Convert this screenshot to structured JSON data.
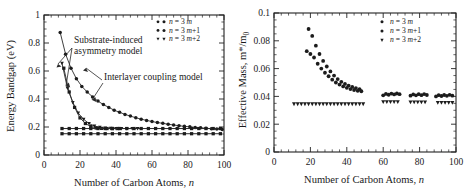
{
  "figure": {
    "panels": [
      "left",
      "right"
    ]
  },
  "chart_data": [
    {
      "type": "scatter",
      "panel": "left",
      "title": "",
      "xlabel": "Number of Carbon Atoms, n",
      "ylabel": "Energy Bandgap (eV)",
      "xlim": [
        0,
        100
      ],
      "ylim": [
        0,
        1
      ],
      "xticks": [
        0,
        20,
        40,
        60,
        80,
        100
      ],
      "yticks": [
        0,
        0.2,
        0.4,
        0.6,
        0.8,
        1
      ],
      "grid": false,
      "legend_position": "top-right",
      "legend": [
        "n = 3m",
        "n = 3m+1",
        "n = 3m+2"
      ],
      "annotations": [
        "Substrate-induced asymmetry model",
        "Interlayer coupling model"
      ],
      "series": [
        {
          "name": "substrate n = 3m",
          "marker": "circle",
          "connected": true,
          "x": [
            9,
            12,
            15,
            18,
            21,
            24,
            27,
            30,
            33,
            36,
            39,
            42,
            45,
            48,
            51,
            54,
            57,
            60,
            63,
            66,
            69,
            72,
            75,
            78,
            81,
            84,
            87,
            90,
            93,
            96,
            99
          ],
          "y": [
            0.875,
            0.72,
            0.62,
            0.545,
            0.49,
            0.45,
            0.415,
            0.385,
            0.36,
            0.34,
            0.32,
            0.305,
            0.29,
            0.278,
            0.266,
            0.256,
            0.247,
            0.239,
            0.232,
            0.226,
            0.22,
            0.214,
            0.209,
            0.205,
            0.201,
            0.197,
            0.194,
            0.191,
            0.188,
            0.185,
            0.183
          ]
        },
        {
          "name": "substrate n = 3m+2",
          "marker": "triangle-down",
          "connected": true,
          "x": [
            10,
            13,
            16,
            19,
            22,
            25,
            28,
            31,
            34,
            37,
            40,
            43,
            46,
            49,
            52
          ],
          "y": [
            0.655,
            0.478,
            0.375,
            0.3,
            0.255,
            0.225,
            0.207,
            0.197,
            0.192,
            0.19,
            0.189,
            0.189,
            0.189,
            0.189,
            0.189
          ]
        },
        {
          "name": "substrate n = 3m+1",
          "marker": "square",
          "connected": true,
          "x": [
            11,
            14,
            17,
            20,
            23,
            26,
            29,
            32,
            35,
            38,
            41
          ],
          "y": [
            0.62,
            0.45,
            0.34,
            0.265,
            0.225,
            0.203,
            0.193,
            0.19,
            0.189,
            0.189,
            0.189
          ]
        },
        {
          "name": "interlayer upper (n = 3m / 3m+1)",
          "marker": "square",
          "connected": true,
          "x": [
            10,
            14,
            18,
            22,
            26,
            30,
            34,
            38,
            42,
            46,
            50,
            54,
            58,
            62,
            66,
            70,
            74,
            78,
            82,
            86,
            90,
            94,
            98
          ],
          "y": [
            0.189,
            0.189,
            0.189,
            0.189,
            0.189,
            0.189,
            0.189,
            0.189,
            0.189,
            0.189,
            0.189,
            0.189,
            0.189,
            0.189,
            0.189,
            0.189,
            0.189,
            0.189,
            0.189,
            0.189,
            0.189,
            0.189,
            0.189
          ]
        },
        {
          "name": "interlayer lower (n = 3m+2)",
          "marker": "square",
          "connected": true,
          "x": [
            10,
            14,
            18,
            22,
            26,
            30,
            34,
            38,
            42,
            46,
            50,
            54,
            58,
            62,
            66,
            70,
            74,
            78,
            82,
            86,
            90,
            94,
            98
          ],
          "y": [
            0.152,
            0.152,
            0.152,
            0.152,
            0.152,
            0.152,
            0.152,
            0.152,
            0.152,
            0.152,
            0.152,
            0.152,
            0.152,
            0.152,
            0.152,
            0.152,
            0.152,
            0.152,
            0.152,
            0.152,
            0.152,
            0.152,
            0.152
          ]
        }
      ]
    },
    {
      "type": "scatter",
      "panel": "right",
      "title": "",
      "xlabel": "Number of Carbon Atoms, n",
      "ylabel": "Effective Mass, m*/m0",
      "xlim": [
        0,
        100
      ],
      "ylim": [
        0,
        0.1
      ],
      "xticks": [
        0,
        20,
        40,
        60,
        80,
        100
      ],
      "yticks": [
        0,
        0.02,
        0.04,
        0.06,
        0.08,
        0.1
      ],
      "grid": false,
      "legend_position": "top-right",
      "legend": [
        "n = 3m",
        "n = 3m+1",
        "n = 3m+2"
      ],
      "annotations": [],
      "series": [
        {
          "name": "descending upper branch",
          "marker": "circle",
          "connected": false,
          "x": [
            19,
            21,
            23,
            25,
            27,
            29,
            31,
            33,
            35,
            37,
            39,
            41,
            43,
            45,
            47
          ],
          "y": [
            0.0885,
            0.0835,
            0.0765,
            0.0705,
            0.0655,
            0.0615,
            0.058,
            0.055,
            0.0525,
            0.0505,
            0.049,
            0.0478,
            0.0468,
            0.046,
            0.0452
          ]
        },
        {
          "name": "descending lower branch",
          "marker": "circle",
          "connected": false,
          "x": [
            18,
            20,
            22,
            24,
            26,
            28,
            30,
            32,
            34,
            36,
            38,
            40,
            42,
            44,
            46,
            48
          ],
          "y": [
            0.0725,
            0.0705,
            0.068,
            0.0635,
            0.06,
            0.057,
            0.0545,
            0.052,
            0.05,
            0.0485,
            0.0472,
            0.0462,
            0.0453,
            0.0446,
            0.044,
            0.0437
          ]
        },
        {
          "name": "flat baseline",
          "marker": "triangle-down",
          "connected": false,
          "x": [
            11,
            13,
            15,
            17,
            19,
            21,
            23,
            25,
            27,
            29,
            31,
            33,
            35,
            37,
            39,
            41,
            43,
            45,
            47,
            49
          ],
          "y": [
            0.0345,
            0.0345,
            0.0345,
            0.0345,
            0.0345,
            0.0345,
            0.0345,
            0.0345,
            0.0345,
            0.0345,
            0.0345,
            0.0345,
            0.0345,
            0.0345,
            0.0345,
            0.0345,
            0.0345,
            0.0345,
            0.0345,
            0.0345
          ]
        },
        {
          "name": "cluster A upper",
          "marker": "circle",
          "connected": false,
          "x": [
            60,
            61.5,
            63,
            64.5,
            66,
            67.5,
            69
          ],
          "y": [
            0.0408,
            0.0418,
            0.0412,
            0.042,
            0.0414,
            0.0421,
            0.0416
          ]
        },
        {
          "name": "cluster A lower",
          "marker": "triangle-down",
          "connected": false,
          "x": [
            60,
            62,
            64,
            66,
            68
          ],
          "y": [
            0.036,
            0.036,
            0.036,
            0.036,
            0.036
          ]
        },
        {
          "name": "cluster B upper",
          "marker": "circle",
          "connected": false,
          "x": [
            75,
            76.5,
            78,
            79.5,
            81,
            82.5,
            84
          ],
          "y": [
            0.0405,
            0.0414,
            0.0408,
            0.0416,
            0.0409,
            0.0417,
            0.041
          ]
        },
        {
          "name": "cluster B lower",
          "marker": "triangle-down",
          "connected": false,
          "x": [
            75,
            77,
            79,
            81,
            83
          ],
          "y": [
            0.0358,
            0.0358,
            0.0358,
            0.0358,
            0.0358
          ]
        },
        {
          "name": "cluster C upper",
          "marker": "circle",
          "connected": false,
          "x": [
            89,
            90.5,
            92,
            93.5,
            95,
            96.5,
            98
          ],
          "y": [
            0.04,
            0.0409,
            0.0403,
            0.041,
            0.0404,
            0.0411,
            0.0405
          ]
        },
        {
          "name": "cluster C lower",
          "marker": "triangle-down",
          "connected": false,
          "x": [
            90,
            92,
            94,
            96,
            98
          ],
          "y": [
            0.0355,
            0.0355,
            0.0355,
            0.0355,
            0.0355
          ]
        }
      ]
    }
  ],
  "left_panel": {
    "ylabel": "Energy Bandgap (eV)",
    "xlabel_pre": "Number of Carbon Atoms, ",
    "xlabel_ital": "n",
    "yticklabels": [
      "0",
      "0.2",
      "0.4",
      "0.6",
      "0.8",
      "1"
    ],
    "xticklabels": [
      "0",
      "20",
      "40",
      "60",
      "80",
      "100"
    ],
    "annotation_substrate_line1": "Substrate-induced",
    "annotation_substrate_line2": "asymmetry model",
    "annotation_interlayer": "Interlayer coupling model",
    "legend": [
      {
        "label_pre": "n",
        "label_eq": " = 3 ",
        "label_m": "m",
        "label_post": ""
      },
      {
        "label_pre": "n",
        "label_eq": " = 3 ",
        "label_m": "m",
        "label_post": "+1"
      },
      {
        "label_pre": "n",
        "label_eq": " = 3 ",
        "label_m": "m",
        "label_post": "+2"
      }
    ]
  },
  "right_panel": {
    "ylabel_pre": "Effective Mass, m*/m",
    "ylabel_sub": "0",
    "xlabel_pre": "Number of Carbon Atoms, ",
    "xlabel_ital": "n",
    "yticklabels": [
      "0",
      "0.02",
      "0.04",
      "0.06",
      "0.08",
      "0.1"
    ],
    "xticklabels": [
      "0",
      "20",
      "40",
      "60",
      "80",
      "100"
    ],
    "legend": [
      {
        "label_pre": "n",
        "label_eq": " = 3 ",
        "label_m": "m",
        "label_post": ""
      },
      {
        "label_pre": "n",
        "label_eq": " = 3 ",
        "label_m": "m",
        "label_post": "+1"
      },
      {
        "label_pre": "n",
        "label_eq": " = 3 ",
        "label_m": "m",
        "label_post": "+2"
      }
    ]
  },
  "colors": {
    "ink": "#1a1a1a",
    "axis": "#222222",
    "marker": "#1c1c1c",
    "background": "#ffffff"
  }
}
